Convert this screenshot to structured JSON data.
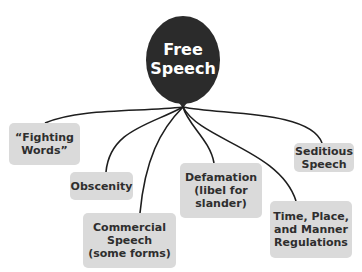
{
  "diagram": {
    "central": {
      "label": "Free\nSpeech",
      "color": "#2b2b2b"
    },
    "branches": [
      {
        "id": "fighting-words",
        "label": "“Fighting\nWords”"
      },
      {
        "id": "obscenity",
        "label": "Obscenity"
      },
      {
        "id": "commercial-speech",
        "label": "Commercial\nSpeech\n(some forms)"
      },
      {
        "id": "defamation",
        "label": "Defamation\n(libel for\nslander)"
      },
      {
        "id": "seditious-speech",
        "label": "Seditious\nSpeech"
      },
      {
        "id": "time-place-manner",
        "label": "Time, Place,\nand Manner\nRegulations"
      }
    ],
    "box_color": "#dadada",
    "line_color": "#1e1e1e"
  }
}
